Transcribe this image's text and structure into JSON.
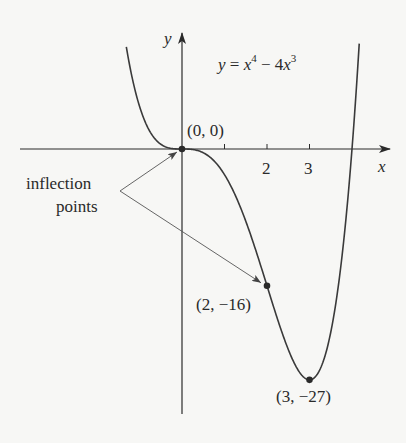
{
  "chart_data": {
    "type": "line",
    "equation": {
      "lhs": "y",
      "eq": " = ",
      "x1": "x",
      "exp1": "4",
      "minus": " − 4",
      "x2": "x",
      "exp2": "3"
    },
    "xlabel": "x",
    "ylabel": "y",
    "x_ticks": [
      1,
      2,
      3
    ],
    "x_tick_labels": [
      "",
      "2",
      "3"
    ],
    "xlim": [
      -4.2,
      4.9
    ],
    "ylim": [
      -31,
      13.5
    ],
    "grid": false,
    "function": "x^4 - 4*x^3",
    "curve_x_range": [
      -1.31,
      4.17
    ],
    "points": [
      {
        "x": 0,
        "y": 0,
        "label": "(0, 0)"
      },
      {
        "x": 2,
        "y": -16,
        "label": "(2, −16)"
      },
      {
        "x": 3,
        "y": -27,
        "label": "(3, −27)"
      }
    ],
    "annotations": [
      {
        "text_line1": "inflection",
        "text_line2": "points",
        "arrows_to": [
          [
            0,
            0
          ],
          [
            2,
            -16
          ]
        ]
      }
    ]
  },
  "colors": {
    "line": "#3a3a3a",
    "background": "#f7f7f5",
    "point": "#2a2a2a"
  }
}
